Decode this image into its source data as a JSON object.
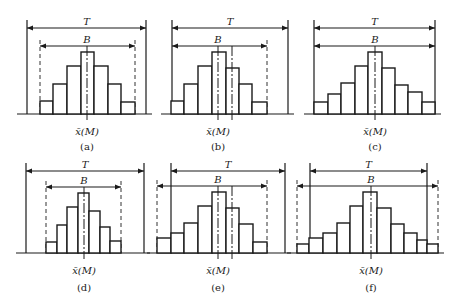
{
  "labels": {
    "T": "T",
    "B": "B",
    "mean": "x̄(M)"
  },
  "panels": [
    {
      "id": "a",
      "caption": "(a)",
      "baseline": 114,
      "T_y": 28,
      "B_y": 46,
      "label_y": 135,
      "caption_y": 150,
      "T": [
        27,
        146
      ],
      "B": [
        40,
        135
      ],
      "B_dashed": [
        true,
        true
      ],
      "edges": [
        40,
        53,
        67,
        81,
        94,
        108,
        121,
        135
      ],
      "tops": [
        101,
        84,
        66,
        52,
        66,
        84,
        102
      ],
      "center_lines": [
        87
      ],
      "mean_x": 87
    },
    {
      "id": "b",
      "caption": "(b)",
      "baseline": 114,
      "T_y": 28,
      "B_y": 46,
      "label_y": 135,
      "caption_y": 150,
      "T": [
        172,
        288
      ],
      "B": [
        172,
        267
      ],
      "B_dashed": [
        false,
        true
      ],
      "edges": [
        171,
        184,
        198,
        212,
        226,
        239,
        252,
        267
      ],
      "tops": [
        101,
        84,
        66,
        52,
        68,
        84,
        102
      ],
      "center_lines": [
        218,
        232
      ],
      "mean_x": 218
    },
    {
      "id": "c",
      "caption": "(c)",
      "baseline": 114,
      "T_y": 28,
      "B_y": 46,
      "label_y": 135,
      "caption_y": 150,
      "T": [
        314,
        435
      ],
      "B": [
        314,
        435
      ],
      "B_dashed": [
        false,
        false
      ],
      "edges": [
        314,
        328,
        341,
        355,
        368,
        382,
        395,
        408,
        422,
        435
      ],
      "tops": [
        102,
        94,
        83,
        66,
        52,
        68,
        85,
        92,
        102
      ],
      "center_lines": [
        375
      ],
      "mean_x": 375
    },
    {
      "id": "d",
      "caption": "(d)",
      "baseline": 253,
      "T_y": 171,
      "B_y": 187,
      "label_y": 274,
      "caption_y": 291,
      "T": [
        26,
        144
      ],
      "B": [
        46,
        121
      ],
      "B_dashed": [
        true,
        true
      ],
      "edges": [
        46,
        57,
        67,
        78,
        89,
        100,
        110,
        121
      ],
      "tops": [
        242,
        225,
        207,
        193,
        211,
        227,
        241
      ],
      "center_lines": [
        84
      ],
      "mean_x": 84
    },
    {
      "id": "e",
      "caption": "(e)",
      "baseline": 253,
      "T_y": 171,
      "B_y": 186,
      "label_y": 274,
      "caption_y": 291,
      "T": [
        171,
        285
      ],
      "B": [
        157,
        267
      ],
      "B_dashed": [
        true,
        true
      ],
      "edges": [
        157,
        171,
        184,
        198,
        212,
        226,
        239,
        253,
        267
      ],
      "tops": [
        238,
        233,
        223,
        206,
        192,
        208,
        224,
        242
      ],
      "center_lines": [
        218,
        232
      ],
      "mean_x": 218
    },
    {
      "id": "f",
      "caption": "(f)",
      "baseline": 253,
      "T_y": 171,
      "B_y": 186,
      "label_y": 274,
      "caption_y": 291,
      "T": [
        310,
        427
      ],
      "B": [
        297,
        438
      ],
      "B_dashed": [
        true,
        true
      ],
      "edges": [
        297,
        309,
        323,
        337,
        350,
        363,
        377,
        391,
        404,
        417,
        427,
        438
      ],
      "tops": [
        244,
        238,
        233,
        223,
        206,
        192,
        208,
        224,
        233,
        240,
        244
      ],
      "center_lines": [
        371
      ],
      "mean_x": 371
    }
  ]
}
